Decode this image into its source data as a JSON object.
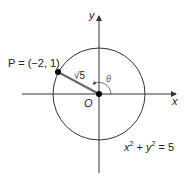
{
  "figure": {
    "axis_x_label": "x",
    "axis_y_label": "y",
    "origin_label": "O",
    "point_label": "P = (−2, 1)",
    "radius_label": "√5",
    "angle_label": "θ",
    "equation": {
      "x": "x",
      "xexp": "2",
      "plus": " + ",
      "y": "y",
      "yexp": "2",
      "rhs": " = 5"
    },
    "colors": {
      "axis": "#333333",
      "circle": "#333333",
      "segment": "#666666",
      "point": "#000000"
    }
  }
}
